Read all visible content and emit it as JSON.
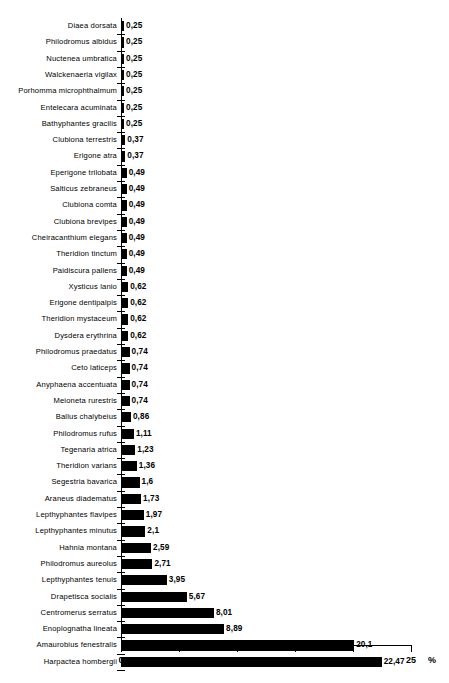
{
  "chart_data": {
    "type": "bar",
    "orientation": "horizontal",
    "title": "",
    "subtitle": "",
    "xlabel": "%",
    "ylabel": "",
    "xlim": [
      0,
      25
    ],
    "xticks": [
      0,
      5,
      10,
      15,
      20,
      25
    ],
    "xtick_labels": [
      "0",
      "5",
      "10",
      "15",
      "20",
      "25"
    ],
    "grid": false,
    "legend": null,
    "categories": [
      "Diaea dorsata",
      "Philodromus albidus",
      "Nuctenea umbratica",
      "Walckenaeria vigilax",
      "Porhomma microphthalmum",
      "Entelecara acuminata",
      "Bathyphantes gracilis",
      "Clubiona terrestris",
      "Erigone atra",
      "Eperigone trilobata",
      "Salticus zebraneus",
      "Clubiona comta",
      "Clubiona brevipes",
      "Cheiracanthium elegans",
      "Theridion tinctum",
      "Paidiscura pallens",
      "Xysticus lanio",
      "Erigone dentipalpis",
      "Theridion mystaceum",
      "Dysdera erythrina",
      "Philodromus praedatus",
      "Ceto laticeps",
      "Anyphaena accentuata",
      "Meioneta rurestris",
      "Ballus chalybeius",
      "Philodromus rufus",
      "Tegenaria atrica",
      "Theridion varians",
      "Segestria bavarica",
      "Araneus diadematus",
      "Lepthyphantes flavipes",
      "Lepthyphantes minutus",
      "Hahnia montana",
      "Philodromus aureolus",
      "Lepthyphantes tenuis",
      "Drapetisca socialis",
      "Centromerus serratus",
      "Enoplognatha lineata",
      "Amaurobius fenestralis",
      "Harpactea hombergii"
    ],
    "values": [
      0.25,
      0.25,
      0.25,
      0.25,
      0.25,
      0.25,
      0.25,
      0.37,
      0.37,
      0.49,
      0.49,
      0.49,
      0.49,
      0.49,
      0.49,
      0.49,
      0.62,
      0.62,
      0.62,
      0.62,
      0.74,
      0.74,
      0.74,
      0.74,
      0.86,
      1.11,
      1.23,
      1.36,
      1.6,
      1.73,
      1.97,
      2.1,
      2.59,
      2.71,
      3.95,
      5.67,
      8.01,
      8.89,
      20.1,
      22.47
    ],
    "value_labels": [
      "0,25",
      "0,25",
      "0,25",
      "0,25",
      "0,25",
      "0,25",
      "0,25",
      "0,37",
      "0,37",
      "0,49",
      "0,49",
      "0,49",
      "0,49",
      "0,49",
      "0,49",
      "0,49",
      "0,62",
      "0,62",
      "0,62",
      "0,62",
      "0,74",
      "0,74",
      "0,74",
      "0,74",
      "0,86",
      "1,11",
      "1,23",
      "1,36",
      "1,6",
      "1,73",
      "1,97",
      "2,1",
      "2,59",
      "2,71",
      "3,95",
      "5,67",
      "8,01",
      "8,89",
      "20,1",
      "22,47"
    ],
    "bar_color": "#000000",
    "background_color": "#ffffff"
  }
}
